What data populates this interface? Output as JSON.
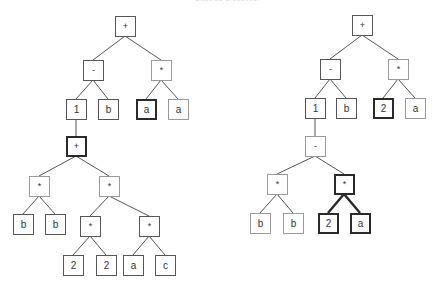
{
  "caption": "Subtree crossover",
  "colors": {
    "edge": "#555555",
    "edge_bold": "#2a2a2a",
    "node_border": "#555555",
    "node_border_light": "#9a9a9a",
    "node_border_bold": "#2a2a2a",
    "text": "#333333"
  },
  "left_tree": {
    "expression": "(1 - b) + ... ; (1 + ((b*b) + ((2*2)*(a*c)))) - b + a*a",
    "nodes": {
      "root": {
        "label": "+"
      },
      "minus": {
        "label": "-"
      },
      "times_top": {
        "label": "*"
      },
      "one": {
        "label": "1"
      },
      "b_top": {
        "label": "b"
      },
      "a_bold": {
        "label": "a"
      },
      "a_plain": {
        "label": "a"
      },
      "plus_bold": {
        "label": "+"
      },
      "times_bb": {
        "label": "*"
      },
      "times_right": {
        "label": "*"
      },
      "b_left": {
        "label": "b"
      },
      "b_right": {
        "label": "b"
      },
      "times_22": {
        "label": "*"
      },
      "times_ac": {
        "label": "*"
      },
      "two_a": {
        "label": "2"
      },
      "two_b": {
        "label": "2"
      },
      "a_low": {
        "label": "a"
      },
      "c_low": {
        "label": "c"
      }
    }
  },
  "right_tree": {
    "nodes": {
      "root": {
        "label": "+"
      },
      "minus": {
        "label": "-"
      },
      "times_top": {
        "label": "*"
      },
      "one": {
        "label": "1"
      },
      "b_top": {
        "label": "b"
      },
      "two_bold": {
        "label": "2"
      },
      "a_plain": {
        "label": "a"
      },
      "minus_low": {
        "label": "-"
      },
      "times_bb": {
        "label": "*"
      },
      "times_bold": {
        "label": "*"
      },
      "b_left": {
        "label": "b"
      },
      "b_right": {
        "label": "b"
      },
      "two_low_bold": {
        "label": "2"
      },
      "a_low_bold": {
        "label": "a"
      }
    }
  }
}
